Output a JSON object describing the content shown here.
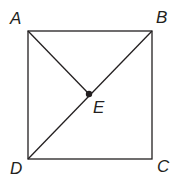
{
  "diagram": {
    "type": "geometry",
    "colors": {
      "stroke": "#231f20",
      "background": "#ffffff"
    },
    "points": {
      "A": {
        "label": "A"
      },
      "B": {
        "label": "B"
      },
      "C": {
        "label": "C"
      },
      "D": {
        "label": "D"
      },
      "E": {
        "label": "E"
      }
    },
    "segments": [
      "AB",
      "BC",
      "CD",
      "DA",
      "AE",
      "DB"
    ]
  }
}
